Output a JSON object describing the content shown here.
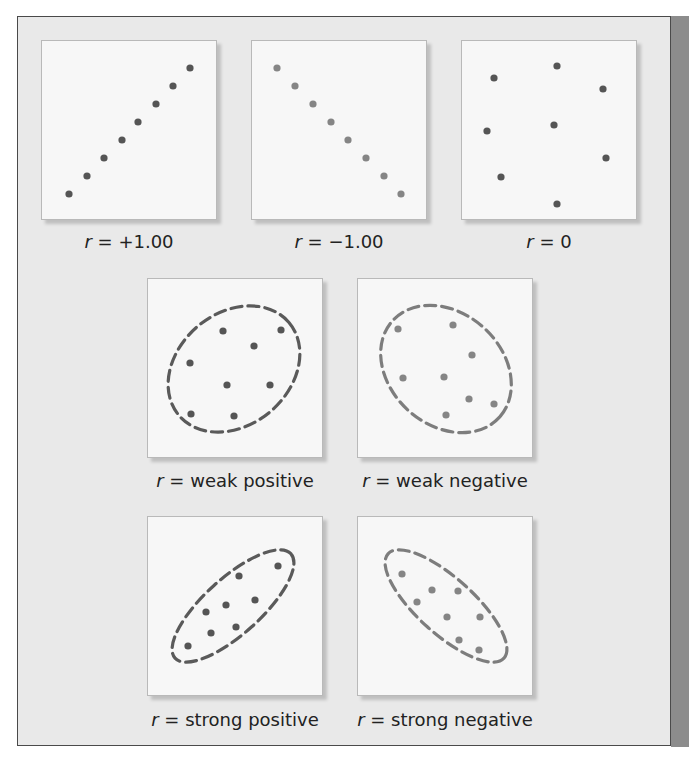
{
  "chart_data": {
    "type": "scatter",
    "title": "",
    "grid": false,
    "axes_visible": false,
    "colors": {
      "dot_dark": "#555555",
      "dot_light": "#858585",
      "ellipse": "#5a5a5a",
      "ellipse_light": "#7d7d7d",
      "panel_bg": "#e9e9e9",
      "box_bg": "#f7f7f7",
      "side_strip": "#8c8c8c"
    },
    "plots": [
      {
        "id": "r-plus-one",
        "label_r": "r",
        "label_rest": " = +1.00",
        "dot_color": "#555555",
        "ellipse": null,
        "points": [
          [
            27,
            153
          ],
          [
            45,
            135
          ],
          [
            62,
            117
          ],
          [
            80,
            99
          ],
          [
            96,
            81
          ],
          [
            114,
            63
          ],
          [
            131,
            45
          ],
          [
            148,
            27
          ]
        ]
      },
      {
        "id": "r-minus-one",
        "label_r": "r",
        "label_rest": " = −1.00",
        "dot_color": "#858585",
        "ellipse": null,
        "points": [
          [
            25,
            27
          ],
          [
            43,
            45
          ],
          [
            61,
            63
          ],
          [
            79,
            81
          ],
          [
            96,
            99
          ],
          [
            114,
            117
          ],
          [
            132,
            135
          ],
          [
            149,
            153
          ]
        ]
      },
      {
        "id": "r-zero",
        "label_r": "r",
        "label_rest": " = 0",
        "dot_color": "#555555",
        "ellipse": null,
        "points": [
          [
            32,
            37
          ],
          [
            95,
            25
          ],
          [
            141,
            48
          ],
          [
            25,
            90
          ],
          [
            92,
            84
          ],
          [
            144,
            117
          ],
          [
            39,
            136
          ],
          [
            95,
            163
          ]
        ]
      },
      {
        "id": "r-weak-positive",
        "label_r": "r",
        "label_rest": " = weak positive",
        "dot_color": "#555555",
        "ellipse": {
          "cx": 86,
          "cy": 90,
          "rx": 72,
          "ry": 56,
          "rotate": -40,
          "color": "#5a5a5a"
        },
        "points": [
          [
            75,
            52
          ],
          [
            133,
            51
          ],
          [
            106,
            67
          ],
          [
            42,
            84
          ],
          [
            79,
            106
          ],
          [
            122,
            106
          ],
          [
            43,
            135
          ],
          [
            86,
            137
          ]
        ]
      },
      {
        "id": "r-weak-negative",
        "label_r": "r",
        "label_rest": " = weak negative",
        "dot_color": "#858585",
        "ellipse": {
          "cx": 88,
          "cy": 90,
          "rx": 72,
          "ry": 56,
          "rotate": 42,
          "color": "#7d7d7d"
        },
        "points": [
          [
            40,
            50
          ],
          [
            95,
            46
          ],
          [
            114,
            76
          ],
          [
            45,
            99
          ],
          [
            86,
            98
          ],
          [
            111,
            120
          ],
          [
            136,
            125
          ],
          [
            88,
            136
          ]
        ]
      },
      {
        "id": "r-strong-positive",
        "label_r": "r",
        "label_rest": " = strong positive",
        "dot_color": "#555555",
        "ellipse": {
          "cx": 85,
          "cy": 89,
          "rx": 78,
          "ry": 28,
          "rotate": -42,
          "color": "#5a5a5a"
        },
        "points": [
          [
            130,
            49
          ],
          [
            91,
            59
          ],
          [
            107,
            83
          ],
          [
            78,
            88
          ],
          [
            58,
            95
          ],
          [
            88,
            110
          ],
          [
            63,
            116
          ],
          [
            40,
            129
          ]
        ]
      },
      {
        "id": "r-strong-negative",
        "label_r": "r",
        "label_rest": " = strong negative",
        "dot_color": "#858585",
        "ellipse": {
          "cx": 88,
          "cy": 89,
          "rx": 78,
          "ry": 28,
          "rotate": 42,
          "color": "#7d7d7d"
        },
        "points": [
          [
            44,
            57
          ],
          [
            74,
            73
          ],
          [
            100,
            74
          ],
          [
            59,
            85
          ],
          [
            89,
            100
          ],
          [
            122,
            100
          ],
          [
            101,
            123
          ],
          [
            121,
            133
          ]
        ]
      }
    ]
  },
  "labels": {
    "plot1": {
      "r": "r",
      "text": " = +1.00"
    },
    "plot2": {
      "r": "r",
      "text": " = −1.00"
    },
    "plot3": {
      "r": "r",
      "text": " = 0"
    },
    "plot4": {
      "r": "r",
      "text": " = weak positive"
    },
    "plot5": {
      "r": "r",
      "text": " = weak negative"
    },
    "plot6": {
      "r": "r",
      "text": " = strong positive"
    },
    "plot7": {
      "r": "r",
      "text": " = strong negative"
    }
  }
}
